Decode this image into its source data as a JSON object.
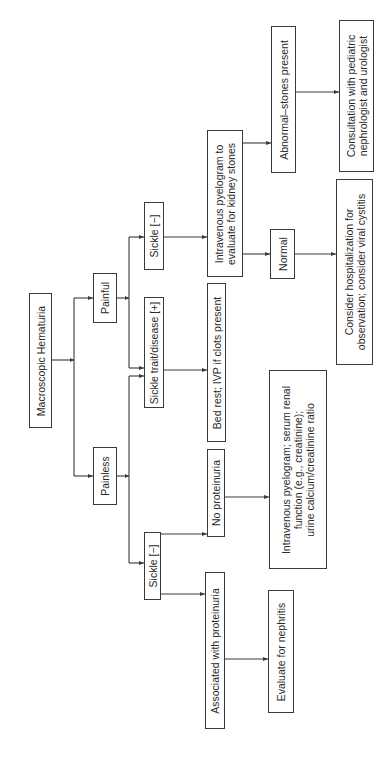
{
  "diagram": {
    "title": "Macroscopic Hematuria",
    "orientation": "rotated -90deg (flows left to right on screen)",
    "nodes": {
      "root": "Macroscopic Hematuria",
      "painful": "Painful",
      "painless": "Painless",
      "sickle_positive": "Sickle trait/disease [+]",
      "sickle_negative_painful": "Sickle [−]",
      "sickle_negative_painless": "Sickle [−]",
      "ivp_kidney_stones": "Intravenous pyelogram to\nevaluate for kidney stones",
      "bed_rest": "Bed rest; IVP if clots present",
      "no_proteinuria": "No proteinuria",
      "with_proteinuria": "Associated with proteinuria",
      "normal": "Normal",
      "abnormal_stones": "Abnormal–stones present",
      "hospitalization": "Consider hospitalization for\nobservation; consider viral cystitis",
      "consultation": "Consultation with pediatric\nnephrologist and urologist",
      "ivp_serum_renal": "Intravenous pyelogram; serum renal\nfunction (e.g., creatinine);\nurine calcium/creatinine ratio",
      "evaluate_nephritis": "Evaluate for nephritis"
    },
    "edges": [
      [
        "root",
        "painful"
      ],
      [
        "root",
        "painless"
      ],
      [
        "painful",
        "sickle_negative_painful"
      ],
      [
        "painful",
        "sickle_positive"
      ],
      [
        "painless",
        "sickle_positive"
      ],
      [
        "painless",
        "sickle_negative_painless"
      ],
      [
        "sickle_negative_painful",
        "ivp_kidney_stones"
      ],
      [
        "sickle_positive",
        "bed_rest"
      ],
      [
        "sickle_negative_painless",
        "no_proteinuria"
      ],
      [
        "sickle_negative_painless",
        "with_proteinuria"
      ],
      [
        "ivp_kidney_stones",
        "normal"
      ],
      [
        "ivp_kidney_stones",
        "abnormal_stones"
      ],
      [
        "normal",
        "hospitalization"
      ],
      [
        "abnormal_stones",
        "consultation"
      ],
      [
        "no_proteinuria",
        "ivp_serum_renal"
      ],
      [
        "with_proteinuria",
        "evaluate_nephritis"
      ]
    ],
    "colors": {
      "line": "#3a3a3a",
      "background": "#ffffff",
      "text": "#2a2a2a"
    }
  }
}
